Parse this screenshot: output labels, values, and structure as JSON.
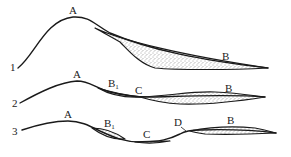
{
  "figure": {
    "colors": {
      "line": "#1a1a1a",
      "stipple": "#444444",
      "background": "#ffffff"
    },
    "profiles": [
      {
        "id": "1",
        "label": "1",
        "labels": {
          "crest": "A",
          "deposit": "B"
        }
      },
      {
        "id": "2",
        "label": "2",
        "labels": {
          "crest": "A",
          "deposit_small": "B",
          "deposit_small_sub": "1",
          "middle": "C",
          "deposit": "B"
        }
      },
      {
        "id": "3",
        "label": "3",
        "labels": {
          "crest": "A",
          "deposit_small": "B",
          "deposit_small_sub": "1",
          "middle": "C",
          "point": "D",
          "deposit": "B"
        }
      }
    ]
  }
}
